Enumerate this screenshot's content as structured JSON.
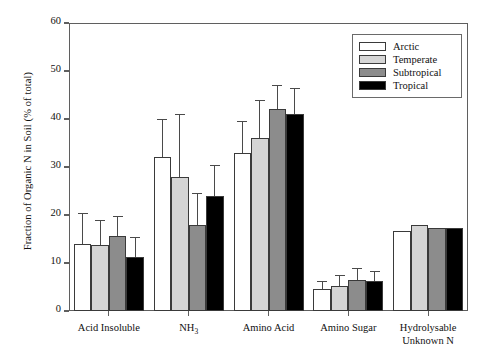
{
  "chart_data": {
    "type": "bar",
    "title": "",
    "xlabel": "",
    "ylabel": "Fraction of Organic N in Soil (% of total)",
    "ylim": [
      0,
      60
    ],
    "yticks": [
      0,
      10,
      20,
      30,
      40,
      50,
      60
    ],
    "ytick_labels": [
      "0",
      "10",
      "20",
      "30",
      "40",
      "50",
      "60"
    ],
    "grid": false,
    "legend_position": "top-right",
    "categories": [
      "Acid Insoluble",
      "NH3",
      "Amino Acid",
      "Amino Sugar",
      "Hydrolysable Unknown N"
    ],
    "category_labels_html": [
      "Acid Insoluble",
      "NH<sub>3</sub>",
      "Amino Acid",
      "Amino Sugar",
      "Hydrolysable<br>Unknown N"
    ],
    "series": [
      {
        "name": "Arctic",
        "color": "#ffffff",
        "values": [
          14.0,
          32.0,
          33.0,
          4.5,
          16.7
        ],
        "err_upper": [
          20.5,
          40.0,
          39.5,
          6.3,
          0.0
        ]
      },
      {
        "name": "Temperate",
        "color": "#d5d5d5",
        "values": [
          13.8,
          28.0,
          36.0,
          5.2,
          18.0
        ],
        "err_upper": [
          19.0,
          41.0,
          44.0,
          7.4,
          0.0
        ]
      },
      {
        "name": "Subtropical",
        "color": "#8c8c8c",
        "values": [
          15.6,
          18.0,
          42.0,
          6.5,
          17.2
        ],
        "err_upper": [
          19.8,
          24.5,
          47.0,
          9.0,
          0.0
        ]
      },
      {
        "name": "Tropical",
        "color": "#000000",
        "values": [
          11.2,
          24.0,
          41.0,
          6.3,
          17.3
        ],
        "err_upper": [
          15.5,
          30.5,
          46.5,
          8.3,
          0.0
        ]
      }
    ]
  },
  "legend": {
    "items": [
      {
        "label": "Arctic",
        "color": "#ffffff"
      },
      {
        "label": "Temperate",
        "color": "#d5d5d5"
      },
      {
        "label": "Subtropical",
        "color": "#8c8c8c"
      },
      {
        "label": "Tropical",
        "color": "#000000"
      }
    ]
  },
  "axes": {
    "y_title": "Fraction of Organic N in Soil (% of total)"
  }
}
